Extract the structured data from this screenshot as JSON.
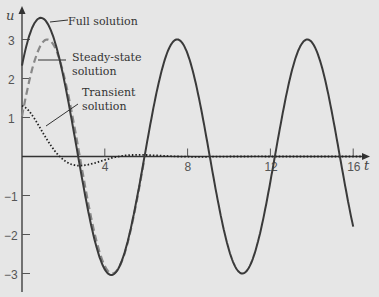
{
  "chart_data": {
    "type": "line",
    "title": "",
    "xlabel": "t",
    "ylabel": "u",
    "xlim": [
      0,
      17
    ],
    "ylim": [
      -3.2,
      3.9
    ],
    "grid": false,
    "x_ticks": [
      4,
      8,
      12,
      16
    ],
    "x_tick_labels": [
      "4",
      "8",
      "12",
      "16"
    ],
    "y_ticks": [
      -3,
      -2,
      -1,
      1,
      2,
      3
    ],
    "y_tick_labels": [
      "−3",
      "−2",
      "−1",
      "1",
      "2",
      "3"
    ],
    "series": [
      {
        "name": "Full solution",
        "style": "solid",
        "description": "steady-state + transient",
        "key_points": [
          [
            0,
            2.1
          ],
          [
            0.9,
            3.6
          ],
          [
            2.5,
            1.2
          ],
          [
            4.4,
            -3.05
          ],
          [
            5.9,
            0
          ],
          [
            7.5,
            2.95
          ],
          [
            9.4,
            0
          ],
          [
            10.8,
            -2.95
          ],
          [
            12.2,
            0
          ],
          [
            13.7,
            2.95
          ],
          [
            15.3,
            0
          ],
          [
            16,
            -1.45
          ]
        ]
      },
      {
        "name": "Steady-state solution",
        "style": "dashed",
        "formula": "3 cos(t - 1.22)",
        "key_points": [
          [
            0,
            1.03
          ],
          [
            1.22,
            3.0
          ],
          [
            2.8,
            0
          ],
          [
            4.36,
            -3.0
          ],
          [
            5.93,
            0
          ],
          [
            7.5,
            3.0
          ]
        ]
      },
      {
        "name": "Transient solution",
        "style": "dotted",
        "formula": "e^(-0.6t)(1.3 cos(1.1t) + 0.6 sin(1.1t))",
        "key_points": [
          [
            0,
            1.3
          ],
          [
            1.5,
            0.45
          ],
          [
            2.5,
            -0.05
          ],
          [
            3.5,
            -0.22
          ],
          [
            5,
            -0.05
          ],
          [
            8,
            0
          ],
          [
            16,
            0
          ]
        ]
      }
    ],
    "annotations": [
      {
        "text": "Full solution",
        "target_series": "Full solution"
      },
      {
        "text": "Steady-state\nsolution",
        "target_series": "Steady-state solution"
      },
      {
        "text": "Transient\nsolution",
        "target_series": "Transient solution"
      }
    ]
  },
  "labels": {
    "full": "Full solution",
    "steady_1": "Steady-state",
    "steady_2": "solution",
    "transient_1": "Transient",
    "transient_2": "solution",
    "x_axis": "t",
    "y_axis": "u"
  }
}
